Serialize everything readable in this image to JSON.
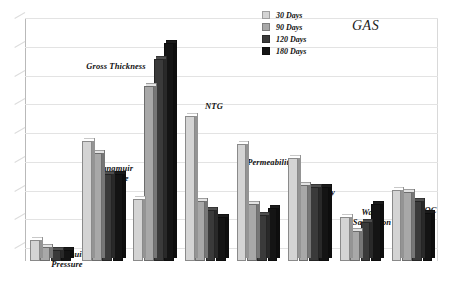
{
  "chart_data": {
    "type": "bar",
    "title": "GAS",
    "xlabel": "",
    "ylabel": "",
    "grid": true,
    "gridline_count": 9,
    "legend_position": "top-right",
    "ylim": [
      0,
      100
    ],
    "categories": [
      "Langmuir\nPressure",
      "Langmuir\nVolume",
      "Gross Thickness",
      "NTG",
      "Permeability",
      "Porosity",
      "Water\nSaturation",
      "TOC"
    ],
    "series": [
      {
        "name": "30 Days",
        "color": "#d4d4d4",
        "values": [
          9,
          52,
          27,
          63,
          51,
          45,
          19,
          31
        ]
      },
      {
        "name": "90 Days",
        "color": "#a8a8a8",
        "values": [
          6,
          47,
          76,
          26,
          25,
          33,
          13,
          30
        ]
      },
      {
        "name": "120 Days",
        "color": "#3a3a3a",
        "values": [
          5,
          38,
          88,
          22,
          20,
          32,
          17,
          26
        ]
      },
      {
        "name": "180 Days",
        "color": "#141414",
        "values": [
          5,
          38,
          95,
          19,
          23,
          32,
          25,
          21
        ]
      }
    ]
  },
  "legend": {
    "items": [
      {
        "label": "30 Days",
        "swatch": "#d4d4d4"
      },
      {
        "label": "90 Days",
        "swatch": "#a8a8a8"
      },
      {
        "label": "120 Days",
        "swatch": "#3a3a3a"
      },
      {
        "label": "180 Days",
        "swatch": "#141414"
      }
    ]
  },
  "labels": {
    "langmuir_pressure": "Langmuir\nPressure",
    "langmuir_volume": "Langmuir\nVolume",
    "gross_thickness": "Gross Thickness",
    "ntg": "NTG",
    "permeability": "Permeability",
    "porosity": "Porosity",
    "water_saturation": "Water\nSaturation",
    "toc": "TOC"
  },
  "caption": ""
}
